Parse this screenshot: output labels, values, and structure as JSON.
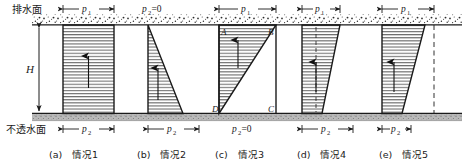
{
  "figure": {
    "type": "engineering-diagram",
    "title_caption_row": [
      {
        "tag": "(a)",
        "label": "情况1"
      },
      {
        "tag": "(b)",
        "label": "情况2"
      },
      {
        "tag": "(c)",
        "label": "情况3"
      },
      {
        "tag": "(d)",
        "label": "情况4"
      },
      {
        "tag": "(e)",
        "label": "情况5"
      }
    ],
    "boundary_labels": {
      "top_surface": "排水面",
      "bottom_surface": "不透水面",
      "height": "H"
    },
    "top_dimension_labels": [
      {
        "text": "p",
        "sub": "1"
      },
      {
        "text": "p",
        "sub": "2",
        "equals": "=0"
      },
      {
        "text": "p",
        "sub": "1"
      },
      {
        "text": "p",
        "sub": "1"
      },
      {
        "text": "p",
        "sub": "1"
      }
    ],
    "bottom_dimension_labels": [
      {
        "text": "p",
        "sub": "2"
      },
      {
        "text": "p",
        "sub": "2"
      },
      {
        "text": "p",
        "sub": "2",
        "equals": "=0"
      },
      {
        "text": "p",
        "sub": "2"
      },
      {
        "text": "p",
        "sub": "2"
      }
    ],
    "corner_labels": {
      "a": "A",
      "b": "B",
      "c": "C",
      "d": "D"
    },
    "colors": {
      "line": "#1a1a1a",
      "hatch": "#4d4d4d",
      "ground_fill": "#b3b3b3",
      "background": "#ffffff"
    }
  }
}
